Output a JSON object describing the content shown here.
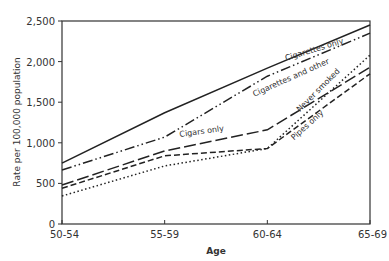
{
  "chart_data": {
    "type": "line",
    "title": "",
    "xlabel": "Age",
    "ylabel": "Rate per 100,000 population",
    "categories": [
      "50-54",
      "55-59",
      "60-64",
      "65-69"
    ],
    "ylim": [
      0,
      2500
    ],
    "yticks": [
      0,
      500,
      1000,
      1500,
      2000,
      2500
    ],
    "ytick_labels": [
      "0",
      "500",
      "1,000",
      "1,500",
      "2,000",
      "2,500"
    ],
    "grid": false,
    "legend": "inline labels",
    "series": [
      {
        "name": "Cigarettes only",
        "style": "solid",
        "values": [
          750,
          1370,
          1920,
          2450
        ],
        "label_pos": [
          315,
          52,
          -17
        ]
      },
      {
        "name": "Cigarettes and other",
        "style": "dashdotdot",
        "values": [
          665,
          1070,
          1820,
          2350
        ],
        "label_pos": [
          292,
          80,
          -24
        ]
      },
      {
        "name": "Cigars only",
        "style": "longdash",
        "values": [
          480,
          900,
          1160,
          1930
        ],
        "label_pos": [
          202,
          134,
          -8
        ]
      },
      {
        "name": "Pipes only",
        "style": "dash",
        "values": [
          440,
          840,
          930,
          1850
        ],
        "label_pos": [
          309,
          127,
          -42
        ]
      },
      {
        "name": "Never smoked",
        "style": "dotted",
        "values": [
          345,
          715,
          930,
          2080
        ],
        "label_pos": [
          320,
          92,
          -45
        ]
      }
    ]
  }
}
